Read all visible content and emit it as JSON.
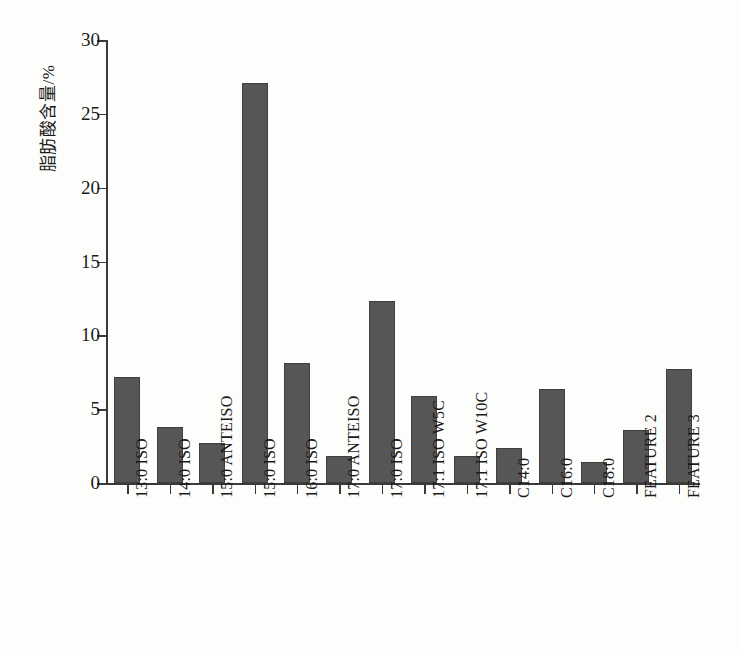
{
  "chart_data": {
    "type": "bar",
    "title": "",
    "subtitle": "",
    "xlabel": "",
    "ylabel": "脂肪酸含量/%",
    "ylim": [
      0,
      30
    ],
    "yticks": [
      0,
      5,
      10,
      15,
      20,
      25,
      30
    ],
    "grid": false,
    "legend": null,
    "bar_color": "#565656",
    "axis_color": "#3a3a3a",
    "categories": [
      "13:0 ISO",
      "14:0 ISO",
      "15:0 ANTEISO",
      "15:0 ISO",
      "16:0 ISO",
      "17:0 ANTEISO",
      "17:0 ISO",
      "17:1 ISO W5C",
      "17:1 ISO W10C",
      "C14:0",
      "C16:0",
      "C18:0",
      "FEATURE 2",
      "FEATURE 3"
    ],
    "values": [
      7.2,
      3.8,
      2.7,
      27.1,
      8.1,
      1.8,
      12.3,
      5.9,
      1.85,
      2.4,
      6.4,
      1.4,
      3.6,
      7.7
    ]
  }
}
